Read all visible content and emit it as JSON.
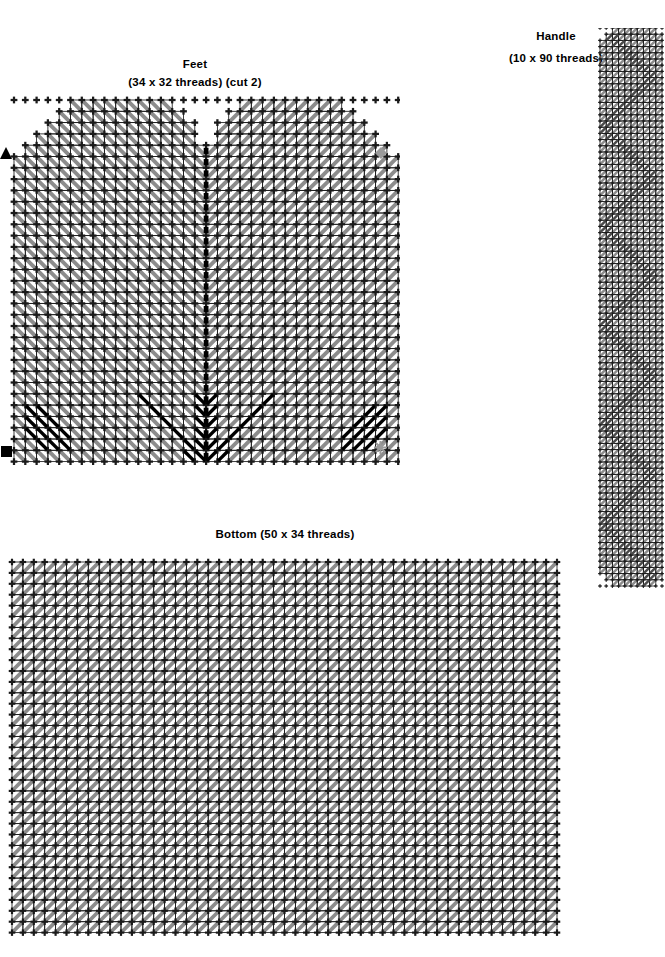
{
  "page": {
    "width": 665,
    "height": 957,
    "background": "#ffffff",
    "kind": "plastic-canvas-stitch-pattern-sheet"
  },
  "colors": {
    "grid_line": "#1a1a1a",
    "stitch_gray": "#8c8c8c",
    "stitch_black": "#000000",
    "marker_black": "#000000",
    "marker_gray": "#9a9a9a",
    "paper": "#ffffff"
  },
  "charts": [
    {
      "id": "feet",
      "title": "Feet",
      "subtitle": "(34 x 32 threads) (cut 2)",
      "cols": 34,
      "rows": 32,
      "cell": 11.3,
      "origin_x": 14,
      "origin_y": 12,
      "shape": "two-domed-feet-with-center-notch",
      "center_fold_line": true,
      "markers": [
        {
          "name": "left-triangle-marker",
          "glyph": "triangle",
          "color": "#000000",
          "x": 2,
          "y": 150
        },
        {
          "name": "right-diamond-marker",
          "glyph": "diamond",
          "color": "#9a9a9a",
          "x": 376,
          "y": 148
        },
        {
          "name": "bottom-left-square-marker",
          "glyph": "square",
          "color": "#000000",
          "x": 2,
          "y": 446
        },
        {
          "name": "bottom-right-asterisk-marker",
          "glyph": "asterisk",
          "color": "#9a9a9a",
          "x": 376,
          "y": 444
        }
      ]
    },
    {
      "id": "bottom",
      "title": "Bottom (50 x 34 threads)",
      "subtitle": "",
      "cols": 50,
      "rows": 34,
      "cell": 10.9,
      "origin_x": 12,
      "origin_y": 10,
      "shape": "rectangle",
      "center_fold_line": false,
      "markers": []
    },
    {
      "id": "handle",
      "title": "Handle",
      "subtitle": "(10 x 90 threads)",
      "cols": 10,
      "rows": 90,
      "cell": 6.2,
      "origin_x": 4,
      "origin_y": 0,
      "shape": "long-strip-rounded-ends",
      "center_fold_line": false,
      "markers": []
    }
  ],
  "chart_data": {
    "type": "table",
    "xlabel": "thread columns",
    "ylabel": "thread rows",
    "legend": [
      {
        "symbol": "gray-diagonal",
        "label": "gray continental stitch"
      },
      {
        "symbol": "black-diagonal",
        "label": "black accent stitch"
      },
      {
        "symbol": "dotted-line",
        "label": "center fold line"
      },
      {
        "symbol": "triangle",
        "label": "left alignment mark"
      },
      {
        "symbol": "diamond",
        "label": "right alignment mark"
      },
      {
        "symbol": "square",
        "label": "bottom-left alignment mark"
      },
      {
        "symbol": "asterisk",
        "label": "bottom-right alignment mark"
      }
    ],
    "pieces": [
      {
        "name": "Feet",
        "width_threads": 34,
        "height_threads": 32,
        "cut": 2
      },
      {
        "name": "Bottom",
        "width_threads": 50,
        "height_threads": 34,
        "cut": 1
      },
      {
        "name": "Handle",
        "width_threads": 10,
        "height_threads": 90,
        "cut": 1
      }
    ]
  }
}
